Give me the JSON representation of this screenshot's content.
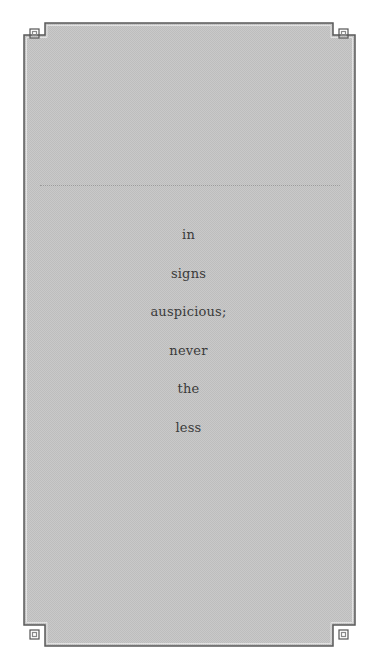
{
  "page": {
    "background": "#ffffff",
    "panel_fill": "#c6c6c6",
    "border_color": "#4a4a4a",
    "text_color": "#3a3a3a"
  },
  "frame": {
    "corner_ornament": "square-notch",
    "divider_style": "dotted"
  },
  "verse": {
    "lines": [
      "in",
      "signs",
      "auspicious;",
      "never",
      "the",
      "less"
    ]
  }
}
